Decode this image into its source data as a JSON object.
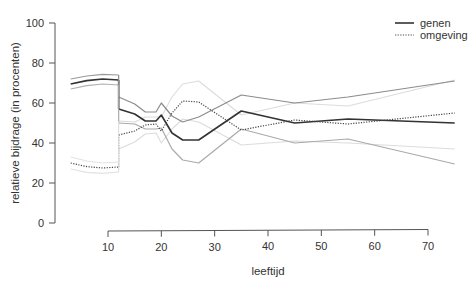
{
  "chart_data": {
    "type": "line",
    "title": "",
    "xlabel": "leeftijd",
    "ylabel": "relatieve bijdrage (in procenten)",
    "xlim": [
      3,
      75
    ],
    "ylim": [
      0,
      100
    ],
    "xticks": [
      10,
      20,
      30,
      40,
      50,
      60,
      70
    ],
    "yticks": [
      0,
      20,
      40,
      60,
      80,
      100
    ],
    "grid": false,
    "legend_position": "top-right",
    "legend": [
      {
        "label": "genen",
        "style": "solid"
      },
      {
        "label": "omgeving",
        "style": "dotted"
      }
    ],
    "series": [
      {
        "name": "genen",
        "style": "solid",
        "color": "#333333",
        "width": 1.6,
        "segment": 1,
        "x": [
          3,
          6,
          9,
          12
        ],
        "y": [
          69.5,
          71.2,
          72,
          71.5
        ]
      },
      {
        "name": "genen",
        "style": "solid",
        "color": "#333333",
        "width": 1.6,
        "segment": 2,
        "x": [
          12,
          15,
          17,
          19,
          20,
          22,
          24,
          27,
          35,
          45,
          55,
          75
        ],
        "y": [
          57,
          54.5,
          51,
          51,
          54,
          45,
          41.5,
          41.5,
          56,
          50,
          52,
          50
        ]
      },
      {
        "name": "genen upper CI",
        "style": "solid",
        "color": "#9a9a9a",
        "width": 1.2,
        "segment": 1,
        "x": [
          3,
          6,
          9,
          12
        ],
        "y": [
          72,
          73.5,
          74.3,
          74
        ]
      },
      {
        "name": "genen upper CI",
        "style": "solid",
        "color": "#8c8c8c",
        "width": 1.2,
        "segment": 2,
        "x": [
          12,
          15,
          17,
          19,
          20,
          22,
          24,
          27,
          35,
          45,
          55,
          75
        ],
        "y": [
          63,
          59.5,
          55.5,
          55.5,
          60,
          53.5,
          50.5,
          53,
          64,
          60,
          63,
          71
        ]
      },
      {
        "name": "genen lower CI",
        "style": "solid",
        "color": "#b0b0b0",
        "width": 1.2,
        "segment": 1,
        "x": [
          3,
          6,
          9,
          12
        ],
        "y": [
          67,
          68.7,
          69.5,
          69
        ]
      },
      {
        "name": "genen lower CI",
        "style": "solid",
        "color": "#aaaaaa",
        "width": 1.2,
        "segment": 2,
        "x": [
          12,
          15,
          17,
          19,
          20,
          22,
          24,
          27,
          35,
          45,
          55,
          75
        ],
        "y": [
          50,
          49.5,
          47,
          47,
          47.5,
          37,
          31.5,
          30,
          47,
          40,
          42,
          29.5
        ]
      },
      {
        "name": "omgeving",
        "style": "dotted",
        "color": "#444444",
        "width": 1.2,
        "segment": 1,
        "x": [
          3,
          6,
          9,
          12
        ],
        "y": [
          30,
          28.2,
          27.5,
          28
        ]
      },
      {
        "name": "omgeving",
        "style": "dotted",
        "color": "#444444",
        "width": 1.2,
        "segment": 2,
        "x": [
          12,
          15,
          17,
          19,
          20,
          22,
          24,
          27,
          35,
          45,
          55,
          75
        ],
        "y": [
          44,
          46,
          49,
          49.5,
          46,
          55,
          61,
          60.5,
          46.5,
          51.5,
          49.5,
          55
        ]
      },
      {
        "name": "omgeving upper CI",
        "style": "solid",
        "color": "#e2e2e2",
        "width": 1.1,
        "segment": 1,
        "x": [
          3,
          6,
          9,
          12
        ],
        "y": [
          33,
          31,
          30,
          30.5
        ]
      },
      {
        "name": "omgeving upper CI",
        "style": "solid",
        "color": "#dcdcdc",
        "width": 1.1,
        "segment": 2,
        "x": [
          12,
          15,
          17,
          19,
          20,
          22,
          24,
          27,
          35,
          45,
          55,
          75
        ],
        "y": [
          51,
          50.5,
          53,
          53,
          53,
          63,
          69.5,
          71,
          54,
          60,
          58.5,
          71.5
        ]
      },
      {
        "name": "omgeving lower CI",
        "style": "solid",
        "color": "#e2e2e2",
        "width": 1.1,
        "segment": 1,
        "x": [
          3,
          6,
          9,
          12
        ],
        "y": [
          27,
          25.3,
          24.8,
          25.5
        ]
      },
      {
        "name": "omgeving lower CI",
        "style": "solid",
        "color": "#dcdcdc",
        "width": 1.1,
        "segment": 2,
        "x": [
          12,
          15,
          17,
          19,
          20,
          22,
          24,
          27,
          35,
          45,
          55,
          75
        ],
        "y": [
          37,
          40.5,
          44.5,
          45,
          40,
          47,
          52,
          50.5,
          39,
          41,
          40,
          37
        ]
      }
    ]
  }
}
